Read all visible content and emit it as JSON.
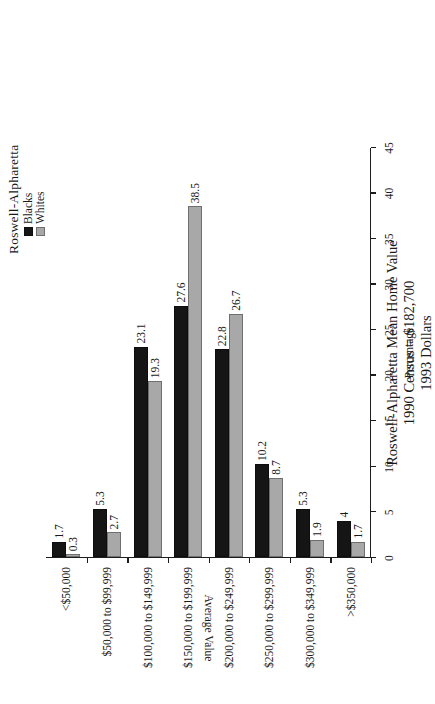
{
  "page": {
    "outer_caption": "Roswell-Alpharetta",
    "background_color": "#ffffff"
  },
  "legend": {
    "items": [
      {
        "label": "Blacks",
        "color": "#151515",
        "swatch": "legend-swatch-blacks"
      },
      {
        "label": "Whites",
        "color": "#a8a8a8",
        "swatch": "legend-swatch-whites"
      }
    ]
  },
  "title": {
    "line1": "Roswell-Alpharetta Mean Home Value",
    "line2": "1990 Census = $182,700",
    "line3": "1993 Dollars"
  },
  "axes": {
    "value_axis_title": "Percentage",
    "category_axis_title": "Average Value",
    "value_ticks": [
      "0",
      "5",
      "10",
      "15",
      "20",
      "25",
      "30",
      "35",
      "40",
      "45"
    ]
  },
  "chart_data": {
    "type": "bar",
    "orientation": "horizontal",
    "title": "Roswell-Alpharetta Mean Home Value\n1990 Census = $182,700\n1993 Dollars",
    "xlabel": "Average Value",
    "ylabel": "Percentage",
    "ylim": [
      0,
      45
    ],
    "ytick_step": 5,
    "grid": false,
    "legend_position": "top-right",
    "categories": [
      "<$50,000",
      "$50,000 to $99,999",
      "$100,000 to $149,999",
      "$150,000 to $199,999",
      "$200,000 to $249,999",
      "$250,000 to $299,999",
      "$300,000 to $349,999",
      ">$350,000"
    ],
    "series": [
      {
        "name": "Blacks",
        "color": "#151515",
        "values": [
          1.7,
          5.3,
          23.1,
          27.6,
          22.8,
          10.2,
          5.3,
          4
        ],
        "labels": [
          "1.7",
          "5.3",
          "23.1",
          "27.6",
          "22.8",
          "10.2",
          "5.3",
          "4"
        ]
      },
      {
        "name": "Whites",
        "color": "#a8a8a8",
        "values": [
          0.3,
          2.7,
          19.3,
          38.5,
          26.7,
          8.7,
          1.9,
          1.7
        ],
        "labels": [
          "0.3",
          "2.7",
          "19.3",
          "38.5",
          "26.7",
          "8.7",
          "1.9",
          "1.7"
        ]
      }
    ]
  }
}
